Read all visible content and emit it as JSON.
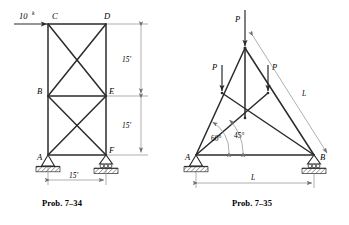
{
  "page": {
    "background_color": "#ffffff",
    "line_color": "#2b2b2b",
    "dim_line_color": "#8d8d8d",
    "text_color": "#000000"
  },
  "figures": [
    {
      "id": "prob-7-34",
      "caption": "Prob. 7–34",
      "type": "rectangular-braced-truss",
      "joints": [
        {
          "name": "A",
          "label": "A",
          "x": 48,
          "y": 155
        },
        {
          "name": "B",
          "label": "B",
          "x": 48,
          "y": 96
        },
        {
          "name": "C",
          "label": "C",
          "x": 48,
          "y": 24
        },
        {
          "name": "D",
          "label": "D",
          "x": 106,
          "y": 24
        },
        {
          "name": "E",
          "label": "E",
          "x": 106,
          "y": 96
        },
        {
          "name": "F",
          "label": "F",
          "x": 106,
          "y": 155
        }
      ],
      "members": [
        {
          "from": "C",
          "to": "D",
          "kind": "chord"
        },
        {
          "from": "B",
          "to": "E",
          "kind": "chord"
        },
        {
          "from": "A",
          "to": "F",
          "kind": "chord"
        },
        {
          "from": "C",
          "to": "B",
          "kind": "vertical"
        },
        {
          "from": "B",
          "to": "A",
          "kind": "vertical"
        },
        {
          "from": "D",
          "to": "E",
          "kind": "vertical"
        },
        {
          "from": "E",
          "to": "F",
          "kind": "vertical"
        },
        {
          "from": "C",
          "to": "E",
          "kind": "diagonal"
        },
        {
          "from": "B",
          "to": "D",
          "kind": "diagonal"
        },
        {
          "from": "B",
          "to": "F",
          "kind": "diagonal"
        },
        {
          "from": "A",
          "to": "E",
          "kind": "diagonal"
        }
      ],
      "loads": [
        {
          "name": "load-10k-at-C",
          "label": "10",
          "superscript": "k",
          "unit": "kips",
          "magnitude": 10,
          "at_joint": "C",
          "direction": "horizontal-right"
        }
      ],
      "supports": [
        {
          "name": "support-A",
          "at_joint": "A",
          "type": "pin"
        },
        {
          "name": "support-F",
          "at_joint": "F",
          "type": "roller"
        }
      ],
      "dimensions": [
        {
          "name": "dim-upper-panel-height",
          "label": "15'",
          "value": 15,
          "unit": "ft",
          "orientation": "vertical",
          "between": "D-E"
        },
        {
          "name": "dim-lower-panel-height",
          "label": "15'",
          "value": 15,
          "unit": "ft",
          "orientation": "vertical",
          "between": "E-F"
        },
        {
          "name": "dim-span",
          "label": "15'",
          "value": 15,
          "unit": "ft",
          "orientation": "horizontal",
          "between": "A-F"
        }
      ]
    },
    {
      "id": "prob-7-35",
      "caption": "Prob. 7–35",
      "type": "triangular-truss",
      "joints": [
        {
          "name": "A",
          "label": "A",
          "x": 196,
          "y": 155
        },
        {
          "name": "B",
          "label": "B",
          "x": 314,
          "y": 155
        },
        {
          "name": "apex",
          "label": "",
          "x": 245,
          "y": 48
        },
        {
          "name": "left",
          "label": "",
          "x": 222,
          "y": 93
        },
        {
          "name": "right",
          "label": "",
          "x": 268,
          "y": 93
        },
        {
          "name": "center",
          "label": "",
          "x": 245,
          "y": 118
        }
      ],
      "members": [
        {
          "from": "A",
          "to": "B",
          "kind": "chord"
        },
        {
          "from": "A",
          "to": "apex",
          "kind": "diagonal"
        },
        {
          "from": "B",
          "to": "apex",
          "kind": "diagonal"
        },
        {
          "from": "apex",
          "to": "center",
          "kind": "vertical"
        },
        {
          "from": "left",
          "to": "center",
          "kind": "diagonal"
        },
        {
          "from": "right",
          "to": "center",
          "kind": "diagonal"
        },
        {
          "from": "A",
          "to": "right",
          "kind": "diagonal"
        },
        {
          "from": "B",
          "to": "left",
          "kind": "diagonal"
        }
      ],
      "loads": [
        {
          "name": "load-P-apex",
          "label": "P",
          "at_joint": "apex",
          "direction": "vertical-down"
        },
        {
          "name": "load-P-left",
          "label": "P",
          "at_joint": "left",
          "direction": "vertical-down"
        },
        {
          "name": "load-P-right",
          "label": "P",
          "at_joint": "right",
          "direction": "vertical-down"
        }
      ],
      "supports": [
        {
          "name": "support-A",
          "at_joint": "A",
          "type": "pin"
        },
        {
          "name": "support-B",
          "at_joint": "B",
          "type": "roller"
        }
      ],
      "angles": [
        {
          "name": "angle-60",
          "label": "60°",
          "value": 60,
          "at_joint": "A",
          "to_member": "A-apex"
        },
        {
          "name": "angle-45",
          "label": "45°",
          "value": 45,
          "at_joint": "A",
          "to_member": "A-right"
        }
      ],
      "dimensions": [
        {
          "name": "dim-span-L",
          "label": "L",
          "orientation": "horizontal",
          "between": "A-B"
        },
        {
          "name": "dim-diagonal-L",
          "label": "L",
          "orientation": "diagonal",
          "between": "apex-B"
        }
      ]
    }
  ]
}
